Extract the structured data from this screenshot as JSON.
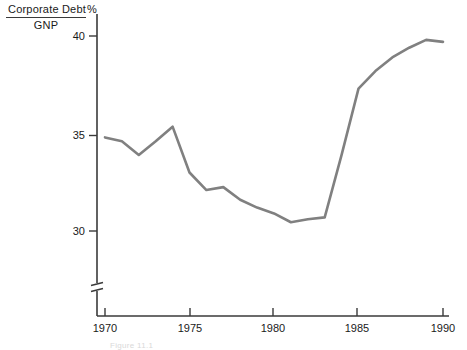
{
  "chart_data": {
    "type": "line",
    "title": "",
    "ylabel_numerator": "Corporate Debt",
    "ylabel_denominator": "GNP",
    "unit_label": "%",
    "xlabel": "",
    "x": [
      1970,
      1971,
      1972,
      1973,
      1974,
      1975,
      1976,
      1977,
      1978,
      1979,
      1980,
      1981,
      1982,
      1983,
      1984,
      1985,
      1986,
      1987,
      1988,
      1989,
      1990
    ],
    "values": [
      34.8,
      34.6,
      33.9,
      34.6,
      35.35,
      33.0,
      32.1,
      32.25,
      31.6,
      31.2,
      30.9,
      30.45,
      30.6,
      30.7,
      33.9,
      37.3,
      38.2,
      38.9,
      39.4,
      39.8,
      39.7
    ],
    "series": [
      {
        "name": "Corporate Debt / GNP",
        "values": [
          34.8,
          34.6,
          33.9,
          34.6,
          35.35,
          33.0,
          32.1,
          32.25,
          31.6,
          31.2,
          30.9,
          30.45,
          30.6,
          30.7,
          33.9,
          37.3,
          38.2,
          38.9,
          39.4,
          39.8,
          39.7
        ]
      }
    ],
    "xticks": [
      1970,
      1975,
      1980,
      1985,
      1990
    ],
    "xtick_labels": [
      "1970",
      "1975",
      "1980",
      "1985",
      "1990"
    ],
    "yticks": [
      30,
      35,
      40
    ],
    "ytick_labels": [
      "30",
      "35",
      "40"
    ],
    "xlim": [
      1970,
      1990
    ],
    "ylim": [
      29.2,
      40.6
    ],
    "grid": false,
    "legend": false,
    "axis_break": true,
    "line_color": "#808080",
    "axis_color": "#3a3a3a"
  },
  "caption": "Figure 11.1"
}
